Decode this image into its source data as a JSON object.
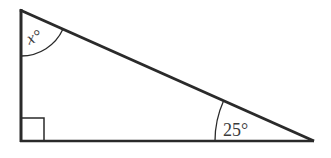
{
  "diagram": {
    "type": "right-triangle",
    "vertices": {
      "top": [
        21,
        10
      ],
      "right_angle": [
        21,
        141
      ],
      "right": [
        313,
        141
      ]
    },
    "angles": [
      {
        "vertex": "top",
        "label": "x°",
        "variable": "x",
        "unit": "degrees"
      },
      {
        "vertex": "right",
        "label": "25°",
        "value": 25,
        "unit": "degrees"
      },
      {
        "vertex": "right_angle",
        "label": "",
        "value": 90,
        "marker": "square"
      }
    ],
    "colors": {
      "stroke": "#2a2a2a",
      "text": "#3a3a3a",
      "background": "#ffffff"
    }
  }
}
